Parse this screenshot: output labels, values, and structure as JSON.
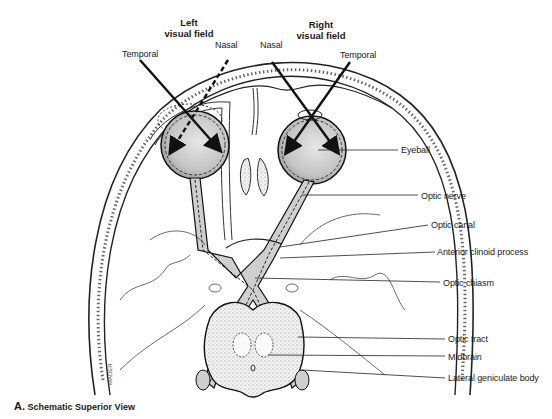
{
  "figure": {
    "caption_letter": "A.",
    "caption_text": "Schematic Superior View",
    "headers": {
      "left_field_line1": "Left",
      "left_field_line2": "visual field",
      "right_field_line1": "Right",
      "right_field_line2": "visual field"
    },
    "top_labels": {
      "left_temporal": "Temporal",
      "left_nasal": "Nasal",
      "right_nasal": "Nasal",
      "right_temporal": "Temporal"
    },
    "leader_labels": [
      {
        "id": "eyeball",
        "text": "Eyeball"
      },
      {
        "id": "optic-nerve",
        "text": "Optic nerve"
      },
      {
        "id": "optic-canal",
        "text": "Optic canal"
      },
      {
        "id": "anterior-clinoid-process",
        "text": "Anterior clinoid process"
      },
      {
        "id": "optic-chiasm",
        "text": "Optic chiasm"
      },
      {
        "id": "optic-tract",
        "text": "Optic tract"
      },
      {
        "id": "midbrain",
        "text": "Midbrain"
      },
      {
        "id": "lateral-geniculate-body",
        "text": "Lateral geniculate body"
      }
    ],
    "signature": "MADER"
  }
}
